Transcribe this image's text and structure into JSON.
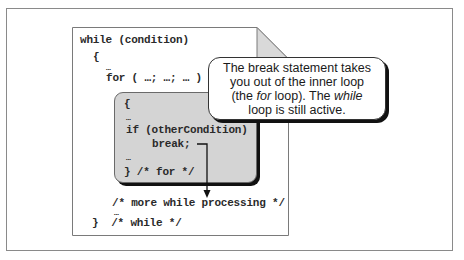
{
  "diagram": {
    "code_lines": {
      "while_header": "while (condition)",
      "while_open": "{",
      "while_ellipsis_1": "…",
      "for_header": "for ( …; …; … )",
      "for_open": "{",
      "for_ellipsis_1": "…",
      "if_line": "if (otherCondition)",
      "break_line": "break;",
      "for_ellipsis_2": "…",
      "for_close": "} /* for */",
      "more_processing": "/* more while processing */",
      "while_ellipsis_2": "…",
      "while_close": "}  /* while */"
    },
    "callout": {
      "line1": "The break statement takes",
      "line2": "you out of the inner loop",
      "line3_pre": "(the ",
      "line3_em1": "for",
      "line3_mid": " loop). The ",
      "line3_em2": "while",
      "line4": "loop is still active."
    },
    "colors": {
      "inner_block_fill": "#d4d4d4",
      "page_fold_fill": "#d9d9d9",
      "shadow": "#111111"
    }
  }
}
